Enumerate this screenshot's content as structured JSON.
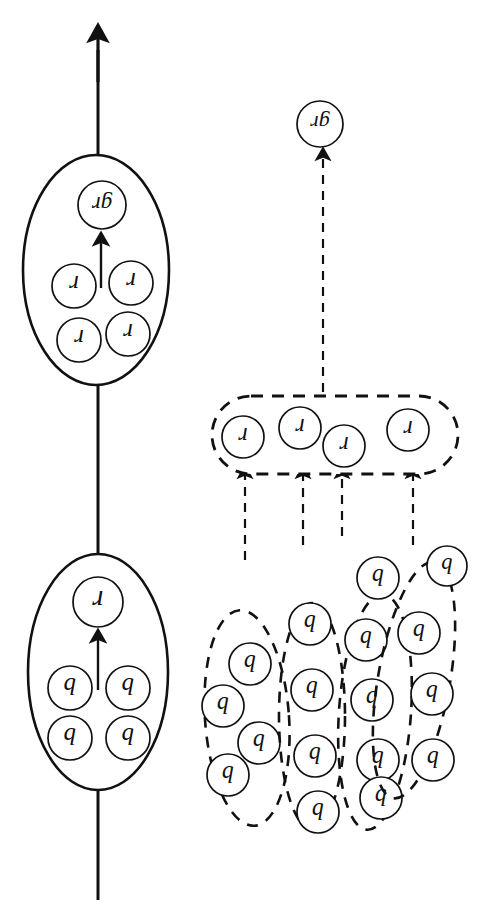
{
  "diagram": {
    "colors": {
      "stroke": "#111111",
      "background": "#ffffff",
      "label": "#111111"
    },
    "labels": {
      "base": "b",
      "refined": "r",
      "group": "gr"
    },
    "left_column": {
      "name": "solid-abstraction-chain",
      "main_axis": {
        "name": "vertical-axis-arrow",
        "x": 98,
        "y_top": 36,
        "y_bottom": 900,
        "arrowhead": "up"
      },
      "lower_ellipse": {
        "name": "solid-group-b",
        "cx": 98,
        "cy": 672,
        "rx": 70,
        "ry": 118,
        "output_label": "r",
        "output": {
          "cx": 98,
          "cy": 602,
          "r": 25
        },
        "inner_arrow": {
          "x": 98,
          "y_from": 690,
          "y_to": 637
        },
        "members": [
          {
            "label": "b",
            "cx": 70,
            "cy": 688,
            "r": 22
          },
          {
            "label": "b",
            "cx": 128,
            "cy": 688,
            "r": 22
          },
          {
            "label": "b",
            "cx": 70,
            "cy": 738,
            "r": 22
          },
          {
            "label": "b",
            "cx": 128,
            "cy": 738,
            "r": 22
          }
        ]
      },
      "upper_ellipse": {
        "name": "solid-group-r",
        "cx": 96,
        "cy": 270,
        "rx": 73,
        "ry": 115,
        "output_label": "gr",
        "output": {
          "cx": 102,
          "cy": 205,
          "r": 24
        },
        "inner_arrow": {
          "x": 101,
          "y_from": 288,
          "y_to": 240
        },
        "members": [
          {
            "label": "r",
            "cx": 74,
            "cy": 286,
            "r": 22
          },
          {
            "label": "r",
            "cx": 131,
            "cy": 283,
            "r": 22
          },
          {
            "label": "r",
            "cx": 79,
            "cy": 340,
            "r": 22
          },
          {
            "label": "r",
            "cx": 128,
            "cy": 334,
            "r": 22
          }
        ]
      }
    },
    "right_column": {
      "name": "dashed-clustering-chain",
      "top_output": {
        "name": "dashed-output-gr",
        "label": "gr",
        "cx": 320,
        "cy": 124,
        "r": 23,
        "arrow": {
          "x": 323,
          "y_from": 392,
          "y_to": 155
        }
      },
      "r_capsule": {
        "name": "dashed-capsule-r",
        "x": 212,
        "y": 396,
        "width": 246,
        "height": 78,
        "radius": 39,
        "members": [
          {
            "label": "r",
            "cx": 243,
            "cy": 437,
            "r": 21
          },
          {
            "label": "r",
            "cx": 300,
            "cy": 428,
            "r": 21
          },
          {
            "label": "r",
            "cx": 344,
            "cy": 446,
            "r": 21
          },
          {
            "label": "r",
            "cx": 408,
            "cy": 430,
            "r": 21
          }
        ]
      },
      "cluster_arrows": [
        {
          "name": "cluster-arrow-1",
          "x": 245,
          "y_from": 560,
          "y_to": 473
        },
        {
          "name": "cluster-arrow-2",
          "x": 303,
          "y_from": 545,
          "y_to": 473
        },
        {
          "name": "cluster-arrow-3",
          "x": 342,
          "y_from": 536,
          "y_to": 473
        },
        {
          "name": "cluster-arrow-4",
          "x": 413,
          "y_from": 545,
          "y_to": 473
        }
      ],
      "b_clusters": [
        {
          "name": "dashed-cluster-1",
          "cx": 247,
          "cy": 718,
          "rx": 42,
          "ry": 108,
          "rotate": -4,
          "members": [
            {
              "label": "b",
              "cx": 250,
              "cy": 664,
              "r": 21
            },
            {
              "label": "b",
              "cx": 223,
              "cy": 706,
              "r": 21
            },
            {
              "label": "b",
              "cx": 259,
              "cy": 743,
              "r": 21
            },
            {
              "label": "b",
              "cx": 228,
              "cy": 775,
              "r": 21
            }
          ]
        },
        {
          "name": "dashed-cluster-2",
          "cx": 312,
          "cy": 716,
          "rx": 33,
          "ry": 113,
          "rotate": 0,
          "members": [
            {
              "label": "b",
              "cx": 310,
              "cy": 624,
              "r": 21
            },
            {
              "label": "b",
              "cx": 312,
              "cy": 690,
              "r": 21
            },
            {
              "label": "b",
              "cx": 315,
              "cy": 756,
              "r": 21
            },
            {
              "label": "b",
              "cx": 318,
              "cy": 812,
              "r": 21
            }
          ]
        },
        {
          "name": "dashed-cluster-3",
          "cx": 375,
          "cy": 712,
          "rx": 36,
          "ry": 118,
          "rotate": 4,
          "members": [
            {
              "label": "b",
              "cx": 366,
              "cy": 640,
              "r": 21
            },
            {
              "label": "b",
              "cx": 372,
              "cy": 700,
              "r": 21
            },
            {
              "label": "b",
              "cx": 378,
              "cy": 760,
              "r": 21
            },
            {
              "label": "b",
              "cx": 381,
              "cy": 798,
              "r": 21
            }
          ]
        },
        {
          "name": "dashed-cluster-4",
          "cx": 414,
          "cy": 680,
          "rx": 36,
          "ry": 120,
          "rotate": 10,
          "members": [
            {
              "label": "b",
              "cx": 378,
              "cy": 578,
              "r": 21
            },
            {
              "label": "b",
              "cx": 419,
              "cy": 633,
              "r": 21
            },
            {
              "label": "b",
              "cx": 432,
              "cy": 694,
              "r": 21
            },
            {
              "label": "b",
              "cx": 433,
              "cy": 760,
              "r": 21
            }
          ]
        }
      ],
      "isolated_node": {
        "name": "isolated-node-b",
        "label": "b",
        "cx": 447,
        "cy": 566,
        "r": 20
      }
    }
  }
}
